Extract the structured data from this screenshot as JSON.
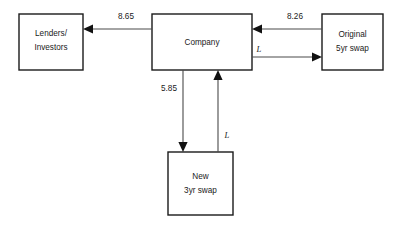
{
  "diagram": {
    "type": "flow-diagram",
    "background_color": "#ffffff",
    "box_stroke_color": "#1a1a1a",
    "line_color": "#4a4a4a",
    "text_color": "#1a1a1a",
    "nodes": [
      {
        "id": "lenders",
        "name": "lenders-investors-box",
        "line1": "Lenders/",
        "line2": "Investors",
        "x": 19,
        "y": 14,
        "w": 64,
        "h": 56
      },
      {
        "id": "company",
        "name": "company-box",
        "line1": "Company",
        "line2": "",
        "x": 152,
        "y": 14,
        "w": 100,
        "h": 56
      },
      {
        "id": "original_swap",
        "name": "original-5yr-swap-box",
        "line1": "Original",
        "line2": "5yr swap",
        "x": 322,
        "y": 14,
        "w": 61,
        "h": 56
      },
      {
        "id": "new_swap",
        "name": "new-3yr-swap-box",
        "line1": "New",
        "line2": "3yr swap",
        "x": 168,
        "y": 152,
        "w": 65,
        "h": 63
      }
    ],
    "flows": [
      {
        "id": "company_to_lenders",
        "name": "flow-company-to-lenders",
        "label": "8.65",
        "label_x": 126,
        "label_y": 17,
        "from": "company",
        "to": "lenders",
        "direction": "left"
      },
      {
        "id": "original_to_company",
        "name": "flow-original-swap-to-company",
        "label": "8.26",
        "label_x": 295,
        "label_y": 17,
        "from": "original_swap",
        "to": "company",
        "direction": "left"
      },
      {
        "id": "company_to_original",
        "name": "flow-company-to-original-swap",
        "label": "L",
        "label_x": 259,
        "label_y": 50,
        "from": "company",
        "to": "original_swap",
        "direction": "right"
      },
      {
        "id": "company_to_new",
        "name": "flow-company-to-new-swap",
        "label": "5.85",
        "label_x": 169,
        "label_y": 89,
        "from": "company",
        "to": "new_swap",
        "direction": "down"
      },
      {
        "id": "new_to_company",
        "name": "flow-new-swap-to-company",
        "label": "L",
        "label_x": 227,
        "label_y": 136,
        "from": "new_swap",
        "to": "company",
        "direction": "up"
      }
    ]
  }
}
